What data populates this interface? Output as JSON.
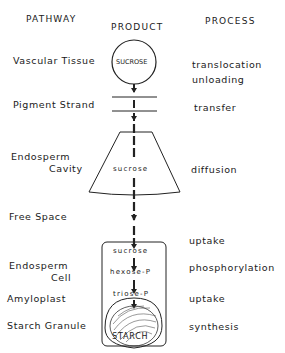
{
  "headers": {
    "pathway": "PATHWAY",
    "product": "PRODUCT",
    "process": "PROCESS"
  },
  "pathway": [
    "Vascular Tissue",
    "Pigment Strand",
    "Endosperm",
    "Cavity",
    "Free Space",
    "Endosperm",
    "Cell",
    "Amyloplast",
    "Starch Granule"
  ],
  "products": {
    "circle": "SUCROSE",
    "cavity": "sucrose",
    "cell_sucrose": "sucrose",
    "hexose": "hexose-P",
    "triose": "triose-P",
    "starch": "STARCH"
  },
  "process": [
    "translocation",
    "unloading",
    "transfer",
    "diffusion",
    "uptake",
    "phosphorylation",
    "uptake",
    "synthesis"
  ]
}
